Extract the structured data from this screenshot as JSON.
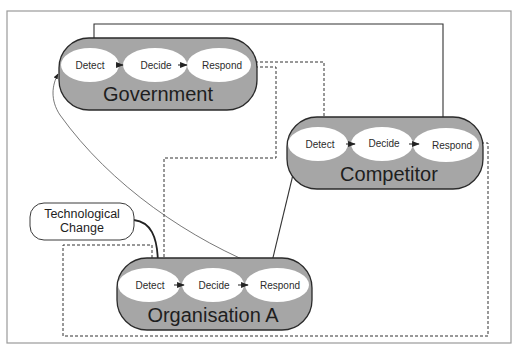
{
  "diagram": {
    "colors": {
      "actor_fill": "#a6a6a6",
      "stage_fill": "#ffffff",
      "line": "#333333",
      "frame": "#9a9a9a"
    },
    "stages": [
      "Detect",
      "Decide",
      "Respond"
    ],
    "actors": {
      "government": {
        "label": "Government",
        "stages": {
          "detect": "Detect",
          "decide": "Decide",
          "respond": "Respond"
        }
      },
      "competitor": {
        "label": "Competitor",
        "stages": {
          "detect": "Detect",
          "decide": "Decide",
          "respond": "Respond"
        }
      },
      "organisation": {
        "label": "Organisation A",
        "stages": {
          "detect": "Detect",
          "decide": "Decide",
          "respond": "Respond"
        }
      }
    },
    "external": {
      "tech_change": {
        "line1": "Technological",
        "line2": "Change"
      }
    },
    "connections": [
      {
        "from": "competitor.respond",
        "to": "government.detect",
        "style": "solid"
      },
      {
        "from": "government.respond",
        "to": "competitor.detect",
        "style": "dashed"
      },
      {
        "from": "government.respond",
        "to": "organisation.detect",
        "style": "dashed"
      },
      {
        "from": "organisation.respond",
        "to": "government.detect",
        "style": "thin-curve"
      },
      {
        "from": "organisation.respond",
        "to": "competitor.detect",
        "style": "solid"
      },
      {
        "from": "competitor.respond",
        "to": "organisation.detect",
        "style": "dashed"
      },
      {
        "from": "external.tech_change",
        "to": "organisation.detect",
        "style": "thick-curve"
      }
    ]
  }
}
